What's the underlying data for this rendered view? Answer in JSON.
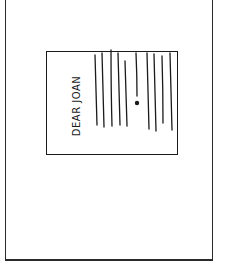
{
  "scene": {
    "description": "Hand-drawn comic panel showing a letter viewed sideways",
    "letter": {
      "greeting": "DEAR JOAN",
      "text_line_count": 9,
      "has_ink_blot": true
    },
    "colors": {
      "ink": "#1a1a1a",
      "paper": "#ffffff"
    }
  }
}
